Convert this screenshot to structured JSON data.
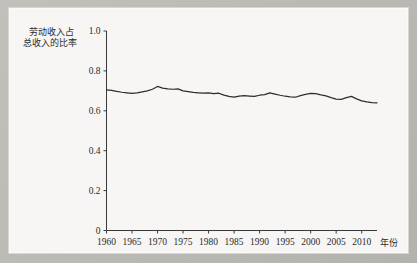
{
  "figure": {
    "background_color": "#b7b5b0",
    "panel_color": "#f7f6f4",
    "line_color": "#2e2e2e",
    "axis_color": "#3a3a3a"
  },
  "axis_titles": {
    "y_line1": "劳动收入占",
    "y_line2": "总收入的比率",
    "x_unit": "年份"
  },
  "chart_data": {
    "type": "line",
    "title": "",
    "subtitle": "",
    "xlabel": "年份",
    "ylabel": "劳动收入占总收入的比率",
    "xlim": [
      1960,
      2013
    ],
    "ylim": [
      0,
      1.0
    ],
    "grid": false,
    "legend": "none",
    "ytick_labels": [
      "0",
      "0.2",
      "0.4",
      "0.6",
      "0.8",
      "1.0"
    ],
    "ytick_values": [
      0,
      0.2,
      0.4,
      0.6,
      0.8,
      1.0
    ],
    "xtick_labels": [
      "1960",
      "1965",
      "1970",
      "1975",
      "1980",
      "1985",
      "1990",
      "1995",
      "2000",
      "2005",
      "2010"
    ],
    "xtick_values": [
      1960,
      1965,
      1970,
      1975,
      1980,
      1985,
      1990,
      1995,
      2000,
      2005,
      2010
    ],
    "series": [
      {
        "name": "劳动收入占总收入的比率",
        "x": [
          1960,
          1961,
          1962,
          1963,
          1964,
          1965,
          1966,
          1967,
          1968,
          1969,
          1970,
          1971,
          1972,
          1973,
          1974,
          1975,
          1976,
          1977,
          1978,
          1979,
          1980,
          1981,
          1982,
          1983,
          1984,
          1985,
          1986,
          1987,
          1988,
          1989,
          1990,
          1991,
          1992,
          1993,
          1994,
          1995,
          1996,
          1997,
          1998,
          1999,
          2000,
          2001,
          2002,
          2003,
          2004,
          2005,
          2006,
          2007,
          2008,
          2009,
          2010,
          2011,
          2012,
          2013
        ],
        "values": [
          0.705,
          0.702,
          0.697,
          0.693,
          0.69,
          0.687,
          0.69,
          0.695,
          0.7,
          0.708,
          0.722,
          0.714,
          0.71,
          0.708,
          0.71,
          0.7,
          0.696,
          0.692,
          0.69,
          0.688,
          0.69,
          0.686,
          0.688,
          0.679,
          0.672,
          0.669,
          0.673,
          0.676,
          0.674,
          0.672,
          0.678,
          0.681,
          0.69,
          0.684,
          0.678,
          0.673,
          0.67,
          0.668,
          0.676,
          0.682,
          0.687,
          0.686,
          0.68,
          0.675,
          0.666,
          0.659,
          0.657,
          0.666,
          0.672,
          0.66,
          0.65,
          0.645,
          0.641,
          0.64
        ]
      }
    ]
  }
}
